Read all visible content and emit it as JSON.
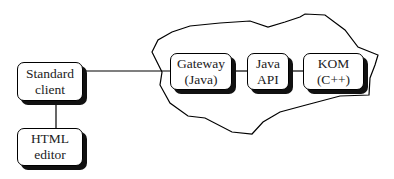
{
  "diagram": {
    "type": "architecture-block-diagram",
    "nodes": [
      {
        "id": "standard_client",
        "line1": "Standard",
        "line2": "client"
      },
      {
        "id": "html_editor",
        "line1": "HTML",
        "line2": "editor"
      },
      {
        "id": "gateway",
        "line1": "Gateway",
        "line2": "(Java)"
      },
      {
        "id": "java_api",
        "line1": "Java",
        "line2": "API"
      },
      {
        "id": "kom",
        "line1": "KOM",
        "line2": "(C++)"
      }
    ],
    "edges": [
      {
        "from": "standard_client",
        "to": "gateway"
      },
      {
        "from": "standard_client",
        "to": "html_editor"
      },
      {
        "from": "gateway",
        "to": "java_api"
      },
      {
        "from": "java_api",
        "to": "kom"
      }
    ],
    "group": {
      "name": "server-boundary",
      "contains": [
        "gateway",
        "java_api",
        "kom"
      ]
    },
    "colors": {
      "stroke": "#000000",
      "shadow": "#111111",
      "background": "#ffffff"
    }
  }
}
